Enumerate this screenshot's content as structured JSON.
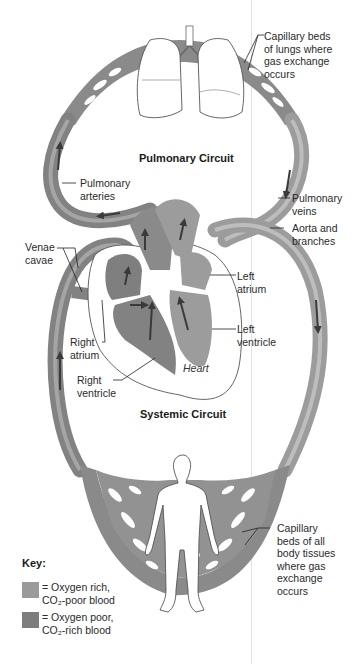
{
  "diagram": {
    "type": "circulatory-system-schematic",
    "circuits": {
      "pulmonary": {
        "title": "Pulmonary Circuit"
      },
      "systemic": {
        "title": "Systemic Circuit"
      }
    },
    "labels": {
      "capillary_lungs": "Capillary beds\nof lungs where\ngas exchange\noccurs",
      "pulmonary_arteries": "Pulmonary\narteries",
      "pulmonary_veins": "Pulmonary\nveins",
      "aorta": "Aorta and\nbranches",
      "venae_cavae": "Venae\ncavae",
      "left_atrium": "Left\natrium",
      "left_ventricle": "Left\nventricle",
      "right_atrium": "Right\natrium",
      "right_ventricle": "Right\nventricle",
      "heart": "Heart",
      "capillary_body": "Capillary\nbeds of all\nbody tissues\nwhere gas\nexchange\noccurs"
    },
    "key": {
      "title": "Key:",
      "items": [
        {
          "text": "= Oxygen rich,\nCO₂-poor blood",
          "color": "#9a9a9a"
        },
        {
          "text": "= Oxygen poor,\nCO₂-rich blood",
          "color": "#7d7d7d"
        }
      ]
    },
    "colors": {
      "vessel_oxygen_rich": "#9a9a9a",
      "vessel_oxygen_poor": "#7f7f7f",
      "vessel_highlight": "#b8b8b8",
      "arrow": "#3a3a3a",
      "organ_outline": "#555555",
      "background": "#ffffff"
    }
  }
}
